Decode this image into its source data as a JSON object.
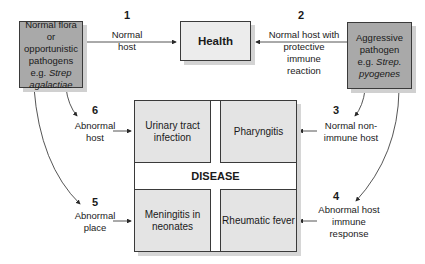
{
  "health": {
    "label": "Health"
  },
  "left_source": {
    "lines": [
      "Normal flora or",
      "opportunistic",
      "pathogens",
      "e.g. "
    ],
    "italic": [
      "Strep",
      "agalactiae"
    ]
  },
  "right_source": {
    "lines": [
      "Aggressive",
      "pathogen",
      "e.g. "
    ],
    "italic": [
      "Strep.",
      "pyogenes"
    ]
  },
  "disease": {
    "label": "DISEASE",
    "quadrants": {
      "top_left": {
        "lines": [
          "Urinary tract",
          "infection"
        ]
      },
      "top_right": {
        "lines": [
          "Pharyngitis"
        ]
      },
      "bottom_left": {
        "lines": [
          "Meningitis in",
          "neonates"
        ]
      },
      "bottom_right": {
        "lines": [
          "Rheumatic fever"
        ]
      }
    }
  },
  "routes": [
    {
      "number": "1",
      "lines": [
        "Normal",
        "host"
      ]
    },
    {
      "number": "2",
      "lines": [
        "Normal host with",
        "protective",
        "immune",
        "reaction"
      ]
    },
    {
      "number": "3",
      "lines": [
        "Normal non-",
        "immune host"
      ]
    },
    {
      "number": "4",
      "lines": [
        "Abnormal host",
        "immune",
        "response"
      ]
    },
    {
      "number": "5",
      "lines": [
        "Abnormal",
        "place"
      ]
    },
    {
      "number": "6",
      "lines": [
        "Abnormal",
        "host"
      ]
    }
  ],
  "colors": {
    "source_box": "#a9a9a9",
    "disease_box": "#e4e4e4",
    "health_box": "#ececec",
    "line": "#2a2a2a"
  }
}
